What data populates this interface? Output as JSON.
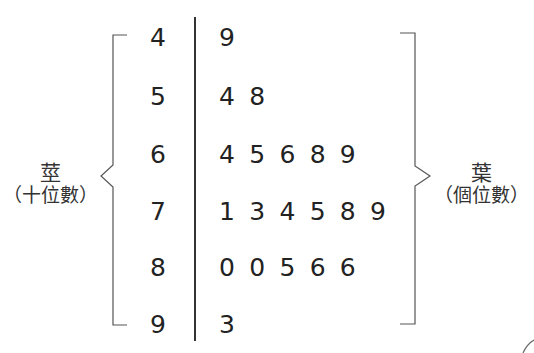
{
  "chart_data": {
    "type": "table",
    "stem_label": "莖",
    "stem_sublabel": "（十位數）",
    "leaf_label": "葉",
    "leaf_sublabel": "（個位數）",
    "rows": [
      {
        "stem": "4",
        "leaves": [
          "9"
        ]
      },
      {
        "stem": "5",
        "leaves": [
          "4",
          "8"
        ]
      },
      {
        "stem": "6",
        "leaves": [
          "4",
          "5",
          "6",
          "8",
          "9"
        ]
      },
      {
        "stem": "7",
        "leaves": [
          "1",
          "3",
          "4",
          "5",
          "8",
          "9"
        ]
      },
      {
        "stem": "8",
        "leaves": [
          "0",
          "0",
          "5",
          "6",
          "6"
        ]
      },
      {
        "stem": "9",
        "leaves": [
          "3"
        ]
      }
    ],
    "values": [
      49,
      54,
      58,
      64,
      65,
      66,
      68,
      69,
      71,
      73,
      74,
      75,
      78,
      79,
      80,
      80,
      85,
      86,
      86,
      93
    ]
  }
}
